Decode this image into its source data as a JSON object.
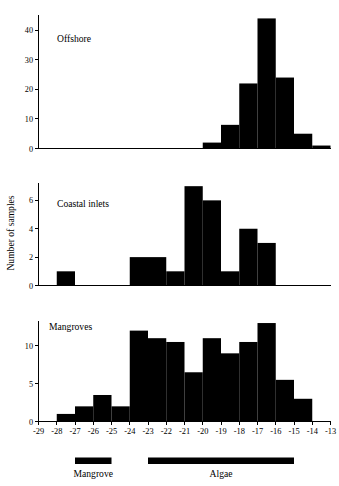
{
  "figure": {
    "y_axis_title": "Number of samples",
    "x_axis_ticks": [
      "-29",
      "-28",
      "-27",
      "-26",
      "-25",
      "-24",
      "-23",
      "-22",
      "-21",
      "-20",
      "-19",
      "-18",
      "-17",
      "-16",
      "-15",
      "-14",
      "-13"
    ],
    "ink_color": "#000000",
    "background_color": "#ffffff"
  },
  "legend": {
    "items": [
      {
        "label": "Mangrove",
        "start": "-27",
        "end": "-25"
      },
      {
        "label": "Algae",
        "start": "-23",
        "end": "-15"
      }
    ]
  },
  "chart_data": [
    {
      "type": "bar",
      "title": "Offshore",
      "xlabel": "",
      "ylabel": "Number of samples",
      "xlim": [
        -29,
        -13
      ],
      "ylim": [
        0,
        46
      ],
      "yticks": [
        0,
        10,
        20,
        30,
        40
      ],
      "ytick_labels": [
        "0",
        "10",
        "20",
        "30",
        "40"
      ],
      "grid": false,
      "bin_width": 1,
      "bin_starts": [
        -29,
        -28,
        -27,
        -26,
        -25,
        -24,
        -23,
        -22,
        -21,
        -20,
        -19,
        -18,
        -17,
        -16,
        -15,
        -14
      ],
      "categories": [
        "-29",
        "-28",
        "-27",
        "-26",
        "-25",
        "-24",
        "-23",
        "-22",
        "-21",
        "-20",
        "-19",
        "-18",
        "-17",
        "-16",
        "-15",
        "-14"
      ],
      "values": [
        0,
        0,
        0,
        0,
        0,
        0,
        0,
        0,
        0,
        2,
        8,
        22,
        44,
        24,
        5,
        1
      ]
    },
    {
      "type": "bar",
      "title": "Coastal inlets",
      "xlabel": "",
      "ylabel": "Number of samples",
      "xlim": [
        -29,
        -13
      ],
      "ylim": [
        0,
        7.4
      ],
      "yticks": [
        0,
        2,
        4,
        6
      ],
      "ytick_labels": [
        "0",
        "2",
        "4",
        "6"
      ],
      "grid": false,
      "bin_width": 1,
      "bin_starts": [
        -29,
        -28,
        -27,
        -26,
        -25,
        -24,
        -23,
        -22,
        -21,
        -20,
        -19,
        -18,
        -17,
        -16,
        -15,
        -14
      ],
      "categories": [
        "-29",
        "-28",
        "-27",
        "-26",
        "-25",
        "-24",
        "-23",
        "-22",
        "-21",
        "-20",
        "-19",
        "-18",
        "-17",
        "-16",
        "-15",
        "-14"
      ],
      "values": [
        0,
        1,
        0,
        0,
        0,
        2,
        2,
        1,
        7,
        6,
        1,
        4,
        3,
        0,
        0,
        0
      ]
    },
    {
      "type": "bar",
      "title": "Mangroves",
      "xlabel": "",
      "ylabel": "Number of samples",
      "xlim": [
        -29,
        -13
      ],
      "ylim": [
        0,
        13.6
      ],
      "yticks": [
        0,
        5,
        10
      ],
      "ytick_labels": [
        "0",
        "5",
        "10"
      ],
      "grid": false,
      "bin_width": 1,
      "bin_starts": [
        -29,
        -28,
        -27,
        -26,
        -25,
        -24,
        -23,
        -22,
        -21,
        -20,
        -19,
        -18,
        -17,
        -16,
        -15,
        -14
      ],
      "categories": [
        "-29",
        "-28",
        "-27",
        "-26",
        "-25",
        "-24",
        "-23",
        "-22",
        "-21",
        "-20",
        "-19",
        "-18",
        "-17",
        "-16",
        "-15",
        "-14"
      ],
      "values": [
        0,
        1,
        2,
        3.5,
        2,
        12,
        11,
        10.5,
        6.5,
        11,
        9,
        10.5,
        13,
        5.5,
        3,
        0
      ]
    }
  ]
}
